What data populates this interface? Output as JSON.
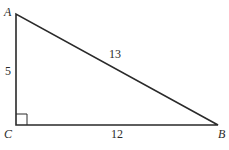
{
  "diagram": {
    "type": "right-triangle",
    "vertices": {
      "A": {
        "label": "A"
      },
      "B": {
        "label": "B"
      },
      "C": {
        "label": "C"
      }
    },
    "sides": {
      "AC": {
        "label": "5"
      },
      "AB": {
        "label": "13"
      },
      "CB": {
        "label": "12"
      }
    },
    "right_angle_at": "C",
    "stroke_color": "#2a2a2a"
  }
}
